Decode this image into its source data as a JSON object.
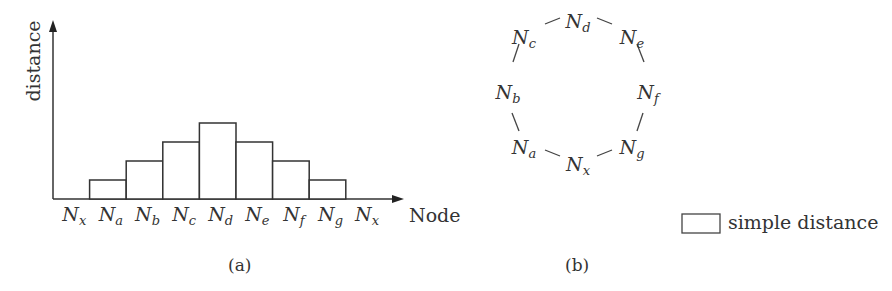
{
  "chart_data": {
    "type": "bar",
    "title": "",
    "xlabel": "Node",
    "ylabel": "distance",
    "categories": [
      "Nx",
      "Na",
      "Nb",
      "Nc",
      "Nd",
      "Ne",
      "Nf",
      "Ng",
      "Nx"
    ],
    "values": [
      0,
      1,
      2,
      3,
      4,
      3,
      2,
      1,
      0
    ],
    "grid": false,
    "legend": [
      {
        "label": "simple distance",
        "style": "outlined box"
      }
    ],
    "legend_position": "bottom-right",
    "caption": "(a)"
  },
  "panel_a": {
    "caption": "(a)",
    "ylabel": "distance",
    "xlabel": "Node",
    "ticks": [
      {
        "base": "N",
        "sub": "x"
      },
      {
        "base": "N",
        "sub": "a"
      },
      {
        "base": "N",
        "sub": "b"
      },
      {
        "base": "N",
        "sub": "c"
      },
      {
        "base": "N",
        "sub": "d"
      },
      {
        "base": "N",
        "sub": "e"
      },
      {
        "base": "N",
        "sub": "f"
      },
      {
        "base": "N",
        "sub": "g"
      },
      {
        "base": "N",
        "sub": "x"
      }
    ]
  },
  "panel_b": {
    "caption": "(b)",
    "ring_nodes": [
      {
        "base": "N",
        "sub": "d"
      },
      {
        "base": "N",
        "sub": "e"
      },
      {
        "base": "N",
        "sub": "f"
      },
      {
        "base": "N",
        "sub": "g"
      },
      {
        "base": "N",
        "sub": "x"
      },
      {
        "base": "N",
        "sub": "a"
      },
      {
        "base": "N",
        "sub": "b"
      },
      {
        "base": "N",
        "sub": "c"
      }
    ]
  },
  "legend": {
    "label": "simple distance"
  }
}
